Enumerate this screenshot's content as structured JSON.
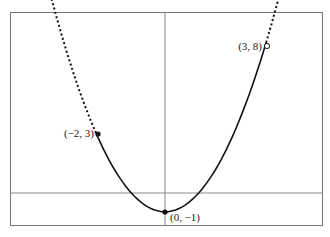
{
  "chart_data": {
    "type": "line",
    "title": "",
    "function": "y = x^2 - 1",
    "xlabel": "",
    "ylabel": "",
    "grid": false,
    "xlim": [
      -4.7,
      4.6
    ],
    "ylim": [
      -1.7,
      9.3
    ],
    "segments": [
      {
        "style": "dashed",
        "x_range": [
          -3.4,
          -2
        ]
      },
      {
        "style": "solid",
        "x_range": [
          -2,
          3
        ]
      },
      {
        "style": "dashed",
        "x_range": [
          3,
          3.45
        ]
      }
    ],
    "points": [
      {
        "x": -2,
        "y": 3,
        "label": "(−2, 3)",
        "marker": "filled"
      },
      {
        "x": 0,
        "y": -1,
        "label": "(0, −1)",
        "marker": "filled"
      },
      {
        "x": 3,
        "y": 8,
        "label": "(3, 8)",
        "marker": "open"
      }
    ]
  },
  "labels": {
    "p1": "(−2, 3)",
    "p2": "(0, −1)",
    "p3": "(3, 8)"
  }
}
